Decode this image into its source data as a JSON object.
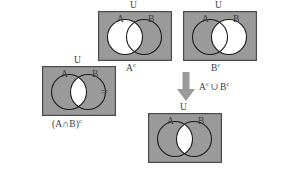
{
  "figure": {
    "colors": {
      "shade": "#9a9a9a",
      "universe_border": "#4a4a4a",
      "circle_stroke": "#1a1a1a",
      "white": "#ffffff",
      "text": "#3a3a3a",
      "arrow": "#9a9a9a"
    },
    "relation_symbol": "=",
    "arrow": {
      "name": "down-arrow",
      "direction": "down"
    }
  },
  "diagrams": [
    {
      "id": "a-intersect-b-complement",
      "caption": "(A∩B)",
      "caption_exponent": "c",
      "universe_label": "U",
      "set_labels": {
        "left": "A",
        "right": "B"
      },
      "shaded_region": "everything except A∩B",
      "white_region": "A∩B lens"
    },
    {
      "id": "a-complement",
      "caption": "A",
      "caption_exponent": "c",
      "universe_label": "U",
      "set_labels": {
        "left": "A",
        "right": "B"
      },
      "shaded_region": "everything except circle A",
      "white_region": "circle A"
    },
    {
      "id": "b-complement",
      "caption": "B",
      "caption_exponent": "c",
      "universe_label": "U",
      "set_labels": {
        "left": "A",
        "right": "B"
      },
      "shaded_region": "everything except circle B",
      "white_region": "circle B"
    },
    {
      "id": "a-complement-union-b-complement",
      "caption": "Aᶜ ∪ Bᶜ",
      "universe_label": "U",
      "set_labels": {
        "left": "A",
        "right": "B"
      },
      "shaded_region": "everything except A∩B",
      "white_region": "A∩B lens"
    }
  ],
  "union_label": {
    "left": "A",
    "left_exponent": "c",
    "operator": "∪",
    "right": "B",
    "right_exponent": "c"
  },
  "intersection_label": {
    "open": "(",
    "left": "A",
    "operator": "∩",
    "right": "B",
    "close": ")",
    "exponent": "c"
  }
}
